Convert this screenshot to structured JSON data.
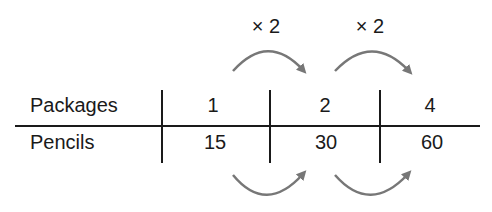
{
  "diagram": {
    "type": "ratio-table",
    "rows": [
      {
        "label": "Packages",
        "values": [
          "1",
          "2",
          "4"
        ]
      },
      {
        "label": "Pencils",
        "values": [
          "15",
          "30",
          "60"
        ]
      }
    ],
    "multipliers": {
      "top": [
        "× 2",
        "× 2"
      ]
    },
    "colors": {
      "text": "#1a1a1a",
      "lines": "#1a1a1a",
      "arrows": "#777777"
    }
  }
}
